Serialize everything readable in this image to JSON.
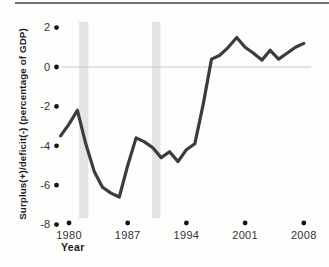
{
  "chart_data": {
    "type": "line",
    "title": "",
    "xlabel": "Year",
    "ylabel": "Surplus(+)/deficit(-) (percentage of GDP)",
    "x_ticks": [
      1980,
      1987,
      1994,
      2001,
      2008
    ],
    "y_ticks": [
      2,
      0,
      -2,
      -4,
      -6,
      -8
    ],
    "xlim": [
      1979,
      2008.6
    ],
    "ylim": [
      -8,
      2
    ],
    "grid": "zero-line-only",
    "legend": "none",
    "tick_style": "filled-dot",
    "recession_bands": [
      {
        "from": 1981.2,
        "to": 1982.3
      },
      {
        "from": 1989.9,
        "to": 1990.9
      }
    ],
    "series": [
      {
        "name": "Budget surplus/deficit (% of GDP)",
        "x": [
          1979,
          1980,
          1981,
          1982,
          1983,
          1984,
          1985,
          1986,
          1987,
          1988,
          1989,
          1990,
          1991,
          1992,
          1993,
          1994,
          1995,
          1996,
          1997,
          1998,
          1999,
          2000,
          2001,
          2002,
          2003,
          2004,
          2005,
          2006,
          2007,
          2008
        ],
        "values": [
          -3.5,
          -2.9,
          -2.2,
          -3.9,
          -5.3,
          -6.1,
          -6.4,
          -6.6,
          -5.0,
          -3.6,
          -3.8,
          -4.1,
          -4.6,
          -4.3,
          -4.8,
          -4.2,
          -3.9,
          -1.9,
          0.4,
          0.6,
          1.0,
          1.5,
          1.0,
          0.7,
          0.35,
          0.85,
          0.4,
          0.7,
          1.0,
          1.2
        ]
      }
    ],
    "colors": {
      "line": "#3c3c3c",
      "tick_dot": "#141414",
      "band": "#e4e4e4",
      "zero_line": "#c9c9c9",
      "text": "#333333",
      "top_rule": "#707070"
    }
  }
}
